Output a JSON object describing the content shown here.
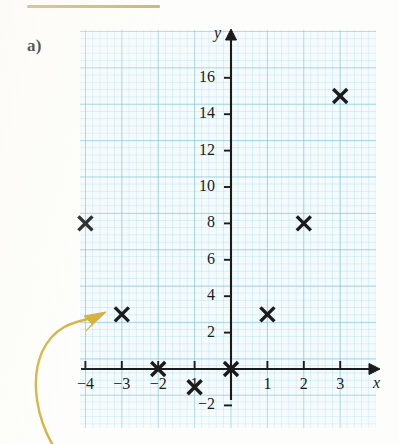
{
  "figure": {
    "part_label": "a)",
    "rule_color": "#c9ab52",
    "arrow_color": "#d4af37",
    "grid_color": "#78bed7",
    "ink_color": "#1b1b1b"
  },
  "chart_data": {
    "type": "scatter",
    "title": "",
    "xlabel": "x",
    "ylabel": "y",
    "x": [
      -4,
      -3,
      -2,
      -1,
      0,
      1,
      2,
      3
    ],
    "y": [
      8,
      3,
      0,
      -1,
      0,
      3,
      8,
      15
    ],
    "points": [
      {
        "x": -4,
        "y": 8
      },
      {
        "x": -3,
        "y": 3
      },
      {
        "x": -2,
        "y": 0
      },
      {
        "x": -1,
        "y": -1
      },
      {
        "x": 0,
        "y": 0
      },
      {
        "x": 1,
        "y": 3
      },
      {
        "x": 2,
        "y": 8
      },
      {
        "x": 3,
        "y": 15
      }
    ],
    "marker": "x",
    "xlim": [
      -4.2,
      3.6
    ],
    "ylim": [
      -2.3,
      17.2
    ],
    "xticks": [
      -4,
      -3,
      -2,
      -1,
      1,
      2,
      3
    ],
    "yticks": [
      -2,
      2,
      4,
      6,
      8,
      10,
      12,
      14,
      16
    ],
    "xtick_labels": [
      "−4",
      "−3",
      "−2",
      "1",
      "1",
      "2",
      "3"
    ],
    "ytick_labels": [
      "−2",
      "2",
      "4",
      "6",
      "8",
      "10",
      "12",
      "14",
      "16"
    ],
    "grid": true,
    "grid_minor": true,
    "legend": "none"
  },
  "axis_labels": {
    "x": "x",
    "y": "y"
  },
  "y_ticks": [
    {
      "value": 16,
      "label": "16"
    },
    {
      "value": 14,
      "label": "14"
    },
    {
      "value": 12,
      "label": "12"
    },
    {
      "value": 10,
      "label": "10"
    },
    {
      "value": 8,
      "label": "8"
    },
    {
      "value": 6,
      "label": "6"
    },
    {
      "value": 4,
      "label": "4"
    },
    {
      "value": 2,
      "label": "2"
    },
    {
      "value": -2,
      "label": "−2"
    }
  ],
  "x_ticks": [
    {
      "value": -4,
      "label": "−4"
    },
    {
      "value": -3,
      "label": "−3"
    },
    {
      "value": -2,
      "label": "−2"
    },
    {
      "value": -1,
      "label": "1"
    },
    {
      "value": 1,
      "label": "1"
    },
    {
      "value": 2,
      "label": "2"
    },
    {
      "value": 3,
      "label": "3"
    }
  ]
}
